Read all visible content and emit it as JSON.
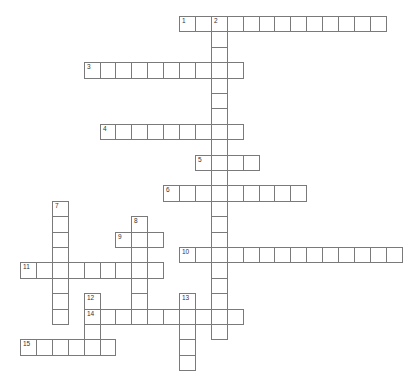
{
  "puzzle": {
    "layout": {
      "origin_x": 20,
      "origin_y": 16,
      "cell_w": 15.9,
      "cell_h": 15.4
    },
    "colors": {
      "border": "#7a7a7a",
      "background": "#ffffff",
      "number": "#333333"
    },
    "entries": [
      {
        "number": "1",
        "direction": "across",
        "row": 0,
        "col": 10,
        "length": 13
      },
      {
        "number": "2",
        "direction": "down",
        "row": 0,
        "col": 12,
        "length": 21
      },
      {
        "number": "3",
        "direction": "across",
        "row": 3,
        "col": 4,
        "length": 10
      },
      {
        "number": "4",
        "direction": "across",
        "row": 7,
        "col": 5,
        "length": 9
      },
      {
        "number": "5",
        "direction": "across",
        "row": 9,
        "col": 11,
        "length": 4
      },
      {
        "number": "6",
        "direction": "across",
        "row": 11,
        "col": 9,
        "length": 9
      },
      {
        "number": "7",
        "direction": "down",
        "row": 12,
        "col": 2,
        "length": 8
      },
      {
        "number": "8",
        "direction": "down",
        "row": 13,
        "col": 7,
        "length": 7
      },
      {
        "number": "9",
        "direction": "across",
        "row": 14,
        "col": 6,
        "length": 3
      },
      {
        "number": "10",
        "direction": "across",
        "row": 15,
        "col": 10,
        "length": 14
      },
      {
        "number": "11",
        "direction": "across",
        "row": 16,
        "col": 0,
        "length": 9
      },
      {
        "number": "12",
        "direction": "down",
        "row": 18,
        "col": 4,
        "length": 3
      },
      {
        "number": "13",
        "direction": "down",
        "row": 18,
        "col": 10,
        "length": 5
      },
      {
        "number": "14",
        "direction": "across",
        "row": 19,
        "col": 4,
        "length": 10
      },
      {
        "number": "15",
        "direction": "across",
        "row": 21,
        "col": 0,
        "length": 6
      }
    ]
  }
}
